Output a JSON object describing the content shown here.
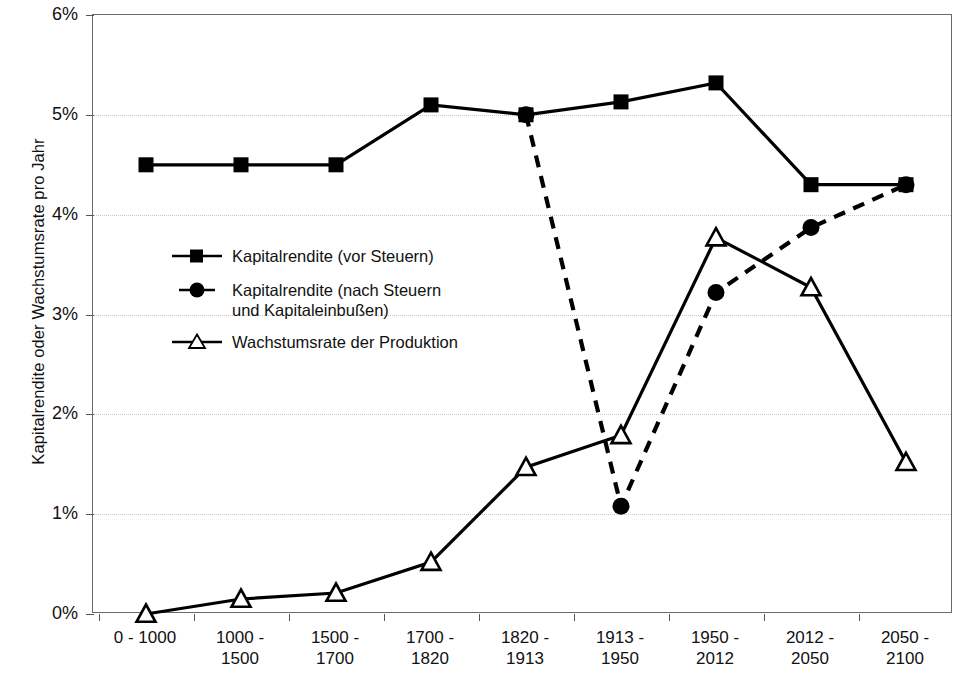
{
  "chart_data": {
    "type": "line",
    "title": "",
    "xlabel": "",
    "ylabel": "Kapitalrendite oder Wachstumsrate pro Jahr",
    "categories": [
      "0 - 1000",
      "1000 - 1500",
      "1500 - 1700",
      "1700 - 1820",
      "1820 - 1913",
      "1913 - 1950",
      "1950 - 2012",
      "2012 - 2050",
      "2050 - 2100"
    ],
    "category_lines": [
      [
        "0 - 1000",
        ""
      ],
      [
        "1000 -",
        "1500"
      ],
      [
        "1500 -",
        "1700"
      ],
      [
        "1700 -",
        "1820"
      ],
      [
        "1820 -",
        "1913"
      ],
      [
        "1913 -",
        "1950"
      ],
      [
        "1950 -",
        "2012"
      ],
      [
        "2012 -",
        "2050"
      ],
      [
        "2050 -",
        "2100"
      ]
    ],
    "ylim": [
      0,
      6
    ],
    "ytick_labels": [
      "6%",
      "5%",
      "4%",
      "3%",
      "2%",
      "1%",
      "0%"
    ],
    "ytick_values": [
      6,
      5,
      4,
      3,
      2,
      1,
      0
    ],
    "grid": true,
    "legend_position": "inside-left",
    "series": [
      {
        "name": "Kapitalrendite (vor Steuern)",
        "marker": "filled-square",
        "line_style": "solid",
        "color": "#000000",
        "values": [
          4.5,
          4.5,
          4.5,
          5.1,
          5.0,
          5.13,
          5.32,
          4.3,
          4.3
        ]
      },
      {
        "name": "Kapitalrendite (nach Steuern und Kapitaleinbußen)",
        "name_line1": "Kapitalrendite (nach Steuern",
        "name_line2": "und Kapitaleinbußen)",
        "marker": "filled-circle",
        "line_style": "dashed",
        "color": "#000000",
        "values": [
          null,
          null,
          null,
          null,
          5.0,
          1.08,
          3.22,
          3.87,
          4.3
        ]
      },
      {
        "name": "Wachstumsrate der Produktion",
        "marker": "open-triangle",
        "line_style": "solid",
        "color": "#000000",
        "values": [
          0.0,
          0.15,
          0.21,
          0.52,
          1.47,
          1.79,
          3.77,
          3.27,
          1.52
        ]
      }
    ]
  }
}
